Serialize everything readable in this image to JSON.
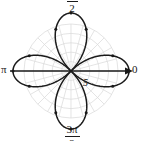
{
  "figure": {
    "kind": "polar-rose-plot",
    "background": "#ffffff",
    "grid_color": "#d8d8d8",
    "curve_color": "#1a1a1a",
    "axis_color": "#1a1a1a",
    "center": {
      "x": 71,
      "y": 71
    },
    "max_radius_px": 58,
    "grid_radius_px": 47
  },
  "labels": {
    "top": {
      "numerator": "π",
      "bar": "",
      "denominator": "2",
      "name": "pi-over-2"
    },
    "bottom": {
      "numerator": "3π",
      "bar": "",
      "denominator": "2",
      "name": "three-pi-over-2"
    },
    "left": "π",
    "right": "0",
    "radial": "5"
  },
  "chart_data": {
    "type": "line",
    "subtype": "polar-rose",
    "title": "",
    "xlabel": "",
    "ylabel": "",
    "equation": "r = 5 cos(2θ)",
    "petal_count": 4,
    "max_r": 5,
    "rlim": [
      0,
      5
    ],
    "theta_labels": [
      "0",
      "π/2",
      "π",
      "3π/2"
    ],
    "theta_label_radians": [
      0,
      1.5708,
      3.14159,
      4.71239
    ],
    "radial_tick_labels": [
      "5"
    ],
    "radial_ticks": [
      5
    ],
    "grid": true,
    "grid_circles": 5,
    "grid_spokes": 24,
    "legend": "none",
    "petals": [
      {
        "direction_deg": 0,
        "peak_r": 5,
        "label": "right-petal"
      },
      {
        "direction_deg": 90,
        "peak_r": 5,
        "label": "top-petal"
      },
      {
        "direction_deg": 180,
        "peak_r": 5,
        "label": "left-petal"
      },
      {
        "direction_deg": 270,
        "peak_r": 5,
        "label": "bottom-petal"
      }
    ],
    "marker_points": [
      {
        "theta_deg": 0,
        "r": 5
      },
      {
        "theta_deg": 20,
        "r": 3.83
      },
      {
        "theta_deg": 340,
        "r": 3.83
      },
      {
        "theta_deg": 90,
        "r": 5
      },
      {
        "theta_deg": 70,
        "r": 3.83
      },
      {
        "theta_deg": 110,
        "r": 3.83
      },
      {
        "theta_deg": 180,
        "r": 5
      },
      {
        "theta_deg": 160,
        "r": 3.83
      },
      {
        "theta_deg": 200,
        "r": 3.83
      },
      {
        "theta_deg": 270,
        "r": 5
      },
      {
        "theta_deg": 250,
        "r": 3.83
      },
      {
        "theta_deg": 290,
        "r": 3.83
      }
    ],
    "axis_arrow": {
      "at_theta_deg": 0,
      "label": "0"
    }
  }
}
